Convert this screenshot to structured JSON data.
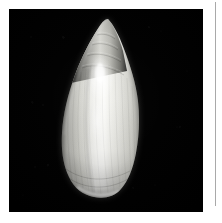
{
  "page": {
    "background_color": "#ffffff",
    "width": 222,
    "height": 223,
    "right_rule_color": "#9a9a9a"
  },
  "photo": {
    "label": "shell-specimen-photograph",
    "background_color": "#000000",
    "frame": {
      "x": 9,
      "y": 9,
      "width": 194,
      "height": 203
    },
    "caption": "",
    "subject": {
      "name": "gastropod-shell",
      "common_description": "elongated fusiform sea shell",
      "orientation": "apex up, aperture side toward viewer",
      "surface": "glossy, with fine vertical growth striations",
      "colors": {
        "highlight": "#ffffff",
        "body_light": "#e9e9e6",
        "body_mid": "#c9c9c4",
        "body_shadow": "#8e8e8a",
        "deep_shadow": "#4a4a48",
        "edge_shadow": "#1d1d1c"
      },
      "geometry": {
        "apex_x": 108,
        "apex_y": 19,
        "base_y": 196,
        "widest_left_x": 68,
        "widest_right_x": 135,
        "widest_y": 130
      }
    }
  }
}
